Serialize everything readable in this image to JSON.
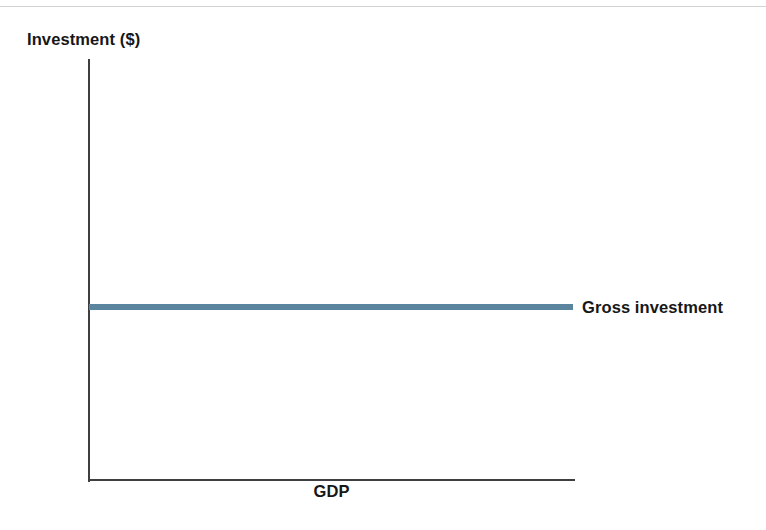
{
  "chart_data": {
    "type": "line",
    "title": "",
    "subtitle": "",
    "xlabel": "GDP",
    "ylabel": "Investment ($)",
    "grid": false,
    "legend_position": "right-inline",
    "x": [
      0,
      1
    ],
    "series": [
      {
        "name": "Gross investment",
        "values": [
          1,
          1
        ],
        "color": "#5b849e",
        "style": "solid-horizontal-constant"
      }
    ],
    "annotations": [
      {
        "text": "Gross investment",
        "position": "end-of-line-right"
      }
    ],
    "axis_notes": {
      "x_ticks": [],
      "y_ticks": [],
      "xlim_labels": [],
      "ylim_labels": []
    }
  },
  "figure": {
    "y_axis_title": "Investment ($)",
    "x_axis_title": "GDP",
    "series_label": "Gross investment"
  },
  "colors": {
    "series_blue": "#5b849e",
    "axis": "#3f3f41",
    "text": "#171717",
    "top_rule": "#d2d2d4",
    "background": "#ffffff"
  }
}
